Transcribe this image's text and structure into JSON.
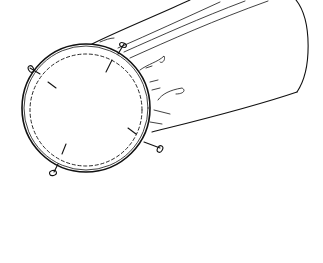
{
  "image": {
    "subject": "drum",
    "description": "Black-and-white line drawing of a cylindrical drum viewed at an angle, showing the round drum head with tuning lugs",
    "colors": {
      "background": "#ffffff",
      "ink": "#111111"
    },
    "lug_count": 4
  }
}
